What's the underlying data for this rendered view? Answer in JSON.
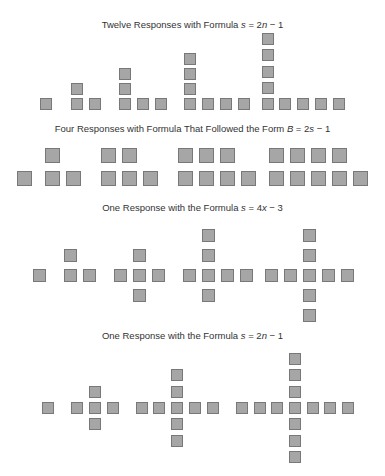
{
  "sections": [
    {
      "title_pre": "Twelve Responses with Formula ",
      "title_formula_var": "s",
      "title_formula_rest": " = 2",
      "title_formula_var2": "n",
      "title_formula_end": " − 1",
      "title_top": 19,
      "square_size": 12,
      "squares": [
        [
          40,
          98
        ],
        [
          71,
          98
        ],
        [
          71,
          83
        ],
        [
          89,
          98
        ],
        [
          119,
          98
        ],
        [
          119,
          83
        ],
        [
          119,
          68
        ],
        [
          137,
          98
        ],
        [
          155,
          98
        ],
        [
          184,
          98
        ],
        [
          184,
          83
        ],
        [
          184,
          68
        ],
        [
          184,
          53
        ],
        [
          202,
          98
        ],
        [
          220,
          98
        ],
        [
          238,
          98
        ],
        [
          262,
          98
        ],
        [
          262,
          82
        ],
        [
          262,
          66
        ],
        [
          262,
          49
        ],
        [
          262,
          33
        ],
        [
          279,
          98
        ],
        [
          297,
          98
        ],
        [
          315,
          98
        ],
        [
          333,
          98
        ]
      ]
    },
    {
      "title_pre": "Four Responses with Formula That Followed the Form ",
      "title_formula_var": "B",
      "title_formula_rest": " = 2",
      "title_formula_var2": "s",
      "title_formula_end": " − 1",
      "title_top": 123,
      "square_size": 15,
      "squares": [
        [
          17,
          171
        ],
        [
          45,
          171
        ],
        [
          66,
          171
        ],
        [
          45,
          148
        ],
        [
          101,
          171
        ],
        [
          122,
          171
        ],
        [
          143,
          171
        ],
        [
          101,
          148
        ],
        [
          122,
          148
        ],
        [
          178,
          171
        ],
        [
          199,
          171
        ],
        [
          220,
          171
        ],
        [
          241,
          171
        ],
        [
          178,
          148
        ],
        [
          199,
          148
        ],
        [
          220,
          148
        ],
        [
          269,
          171
        ],
        [
          290,
          171
        ],
        [
          311,
          171
        ],
        [
          332,
          171
        ],
        [
          353,
          171
        ],
        [
          269,
          148
        ],
        [
          290,
          148
        ],
        [
          311,
          148
        ],
        [
          332,
          148
        ]
      ]
    },
    {
      "title_pre": "One Response with the Formula ",
      "title_formula_var": "s",
      "title_formula_rest": " = 4",
      "title_formula_var2": "x",
      "title_formula_end": " − 3",
      "title_top": 202,
      "square_size": 13,
      "squares": [
        [
          33,
          269
        ],
        [
          64,
          269
        ],
        [
          64,
          249
        ],
        [
          83,
          269
        ],
        [
          114,
          269
        ],
        [
          133,
          269
        ],
        [
          152,
          269
        ],
        [
          133,
          249
        ],
        [
          133,
          289
        ],
        [
          183,
          269
        ],
        [
          202,
          269
        ],
        [
          221,
          269
        ],
        [
          240,
          269
        ],
        [
          202,
          229
        ],
        [
          202,
          249
        ],
        [
          202,
          289
        ],
        [
          265,
          269
        ],
        [
          284,
          269
        ],
        [
          303,
          269
        ],
        [
          322,
          269
        ],
        [
          341,
          269
        ],
        [
          303,
          229
        ],
        [
          303,
          249
        ],
        [
          303,
          289
        ],
        [
          303,
          309
        ]
      ]
    },
    {
      "title_pre": "One Response with the Formula ",
      "title_formula_var": "s",
      "title_formula_rest": " = 2",
      "title_formula_var2": "n",
      "title_formula_end": " − 1",
      "title_top": 330,
      "square_size": 12,
      "squares": [
        [
          42,
          402
        ],
        [
          71,
          402
        ],
        [
          89,
          402
        ],
        [
          107,
          402
        ],
        [
          89,
          386
        ],
        [
          89,
          418
        ],
        [
          136,
          402
        ],
        [
          153,
          402
        ],
        [
          171,
          402
        ],
        [
          189,
          402
        ],
        [
          207,
          402
        ],
        [
          171,
          369
        ],
        [
          171,
          386
        ],
        [
          171,
          418
        ],
        [
          171,
          435
        ],
        [
          236,
          402
        ],
        [
          254,
          402
        ],
        [
          271,
          402
        ],
        [
          289,
          402
        ],
        [
          307,
          402
        ],
        [
          324,
          402
        ],
        [
          342,
          402
        ],
        [
          289,
          353
        ],
        [
          289,
          369
        ],
        [
          289,
          386
        ],
        [
          289,
          418
        ],
        [
          289,
          435
        ],
        [
          289,
          451
        ]
      ]
    }
  ],
  "colors": {
    "square_fill": "#a6a6a6",
    "square_border": "#787878",
    "text": "#333333"
  }
}
